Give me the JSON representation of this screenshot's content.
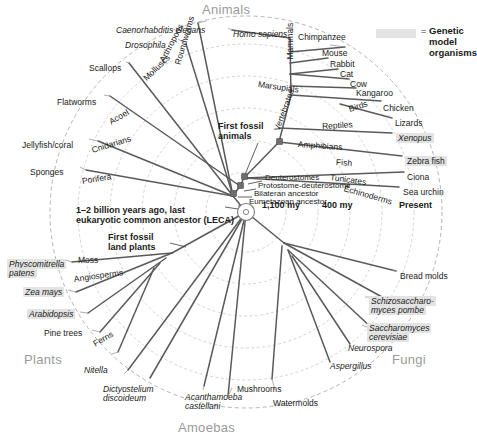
{
  "figure": {
    "type": "radial-phylogenetic-tree",
    "center": {
      "x": 246,
      "y": 212
    },
    "kingdoms": [
      {
        "name": "Animals",
        "x": 202,
        "y": 4,
        "align": "left"
      },
      {
        "name": "Fungi",
        "x": 392,
        "y": 355,
        "align": "left"
      },
      {
        "name": "Plants",
        "x": 24,
        "y": 356,
        "align": "left"
      },
      {
        "name": "Amoebas",
        "x": 178,
        "y": 424,
        "align": "left"
      }
    ],
    "time_axis": [
      {
        "label": "1,100 my",
        "x": 262,
        "y": 206
      },
      {
        "label": "400 my",
        "x": 322,
        "y": 206
      },
      {
        "label": "Present",
        "x": 399,
        "y": 206
      }
    ],
    "legend": {
      "swatch_color": "#e3e3e3",
      "equals": "=",
      "line1": "Genetic model",
      "line2": "organisms"
    },
    "node_labels": [
      {
        "text": "Deuterostomes",
        "x": 262,
        "y": 178
      },
      {
        "text": "Protostome-deuterostome",
        "x": 258,
        "y": 186
      },
      {
        "text": "Bilateran ancestor",
        "x": 254,
        "y": 194
      },
      {
        "text": "Eumetazoan ancestor",
        "x": 248,
        "y": 202
      }
    ],
    "annotations": [
      {
        "text": "First fossil",
        "line2": "animals",
        "x": 218,
        "y": 126,
        "bold": true
      },
      {
        "text": "First fossil",
        "line2": "land plants",
        "x": 108,
        "y": 237,
        "bold": true
      },
      {
        "text": "1–2 billion years ago, last",
        "line2": "eukaryotic common ancestor (LECA)",
        "x": 76,
        "y": 210,
        "bold": true
      }
    ],
    "branch_names": [
      {
        "text": "Roundworms",
        "x": 178,
        "y": 60,
        "rot": -74
      },
      {
        "text": "Arthropods",
        "x": 162,
        "y": 57,
        "rot": -62
      },
      {
        "text": "Molluscs",
        "x": 145,
        "y": 75,
        "rot": -44
      },
      {
        "text": "Acoel",
        "x": 110,
        "y": 118,
        "rot": -30
      },
      {
        "text": "Cnidarians",
        "x": 92,
        "y": 146,
        "rot": -17
      },
      {
        "text": "Porifera",
        "x": 82,
        "y": 177,
        "rot": -9
      },
      {
        "text": "Mammals",
        "x": 291,
        "y": 55,
        "rot": -90
      },
      {
        "text": "Vertebrates",
        "x": 277,
        "y": 126,
        "rot": -70
      },
      {
        "text": "Marsupials",
        "x": 258,
        "y": 80,
        "rot": 8
      },
      {
        "text": "Birds",
        "x": 349,
        "y": 105,
        "rot": -18
      },
      {
        "text": "Reptiles",
        "x": 322,
        "y": 122,
        "rot": -3
      },
      {
        "text": "Amphibians",
        "x": 298,
        "y": 140,
        "rot": 4
      },
      {
        "text": "Fish",
        "x": 336,
        "y": 158,
        "rot": 4
      },
      {
        "text": "Tunicates",
        "x": 330,
        "y": 173,
        "rot": 8
      },
      {
        "text": "Echinoderms",
        "x": 344,
        "y": 184,
        "rot": 16
      },
      {
        "text": "Moss",
        "x": 78,
        "y": 256,
        "rot": 0
      },
      {
        "text": "Angiosperms",
        "x": 74,
        "y": 275,
        "rot": -8
      },
      {
        "text": "Ferns",
        "x": 94,
        "y": 340,
        "rot": -30
      },
      {
        "text": "Mushrooms",
        "x": 237,
        "y": 385,
        "rot": 0
      },
      {
        "text": "Watermolds",
        "x": 273,
        "y": 399,
        "rot": 0
      },
      {
        "text": "Aspergillus",
        "x": 330,
        "y": 362,
        "rot": 0,
        "italic": true
      },
      {
        "text": "Neurospora",
        "x": 348,
        "y": 344,
        "rot": 0,
        "italic": true
      }
    ],
    "tips": [
      {
        "text": "Caenorhabditis elegans",
        "x": 116,
        "y": 26,
        "align": "left",
        "italic": true,
        "model": false
      },
      {
        "text": "Drosophila",
        "x": 125,
        "y": 41,
        "align": "left",
        "italic": true,
        "model": false
      },
      {
        "text": "Scallops",
        "x": 89,
        "y": 64,
        "align": "left",
        "italic": false,
        "model": false
      },
      {
        "text": "Flatworms",
        "x": 57,
        "y": 98,
        "align": "left",
        "italic": false,
        "model": false
      },
      {
        "text": "Jellyfish/coral",
        "x": 22,
        "y": 141,
        "align": "left",
        "italic": false,
        "model": false
      },
      {
        "text": "Sponges",
        "x": 30,
        "y": 168,
        "align": "left",
        "italic": false,
        "model": false
      },
      {
        "text": "Homo sapiens",
        "x": 233,
        "y": 30,
        "align": "left",
        "italic": true,
        "model": false
      },
      {
        "text": "Chimpanzee",
        "x": 298,
        "y": 33,
        "align": "left",
        "italic": false,
        "model": false
      },
      {
        "text": "Mouse",
        "x": 322,
        "y": 49,
        "align": "left",
        "italic": false,
        "model": false
      },
      {
        "text": "Rabbit",
        "x": 330,
        "y": 60,
        "align": "left",
        "italic": false,
        "model": false
      },
      {
        "text": "Cat",
        "x": 340,
        "y": 70,
        "align": "left",
        "italic": false,
        "model": false
      },
      {
        "text": "Cow",
        "x": 350,
        "y": 80,
        "align": "left",
        "italic": false,
        "model": false
      },
      {
        "text": "Kangaroo",
        "x": 356,
        "y": 89,
        "align": "left",
        "italic": false,
        "model": false
      },
      {
        "text": "Chicken",
        "x": 383,
        "y": 104,
        "align": "left",
        "italic": false,
        "model": false
      },
      {
        "text": "Lizards",
        "x": 395,
        "y": 119,
        "align": "left",
        "italic": false,
        "model": false
      },
      {
        "text": "Xenopus",
        "x": 396,
        "y": 134,
        "align": "left",
        "italic": true,
        "model": true
      },
      {
        "text": "Zebra fish",
        "x": 405,
        "y": 157,
        "align": "left",
        "italic": false,
        "model": true
      },
      {
        "text": "Ciona",
        "x": 407,
        "y": 173,
        "align": "left",
        "italic": false,
        "model": false
      },
      {
        "text": "Sea urchin",
        "x": 403,
        "y": 188,
        "align": "left",
        "italic": false,
        "model": false
      },
      {
        "text": "Bread molds",
        "x": 400,
        "y": 272,
        "align": "left",
        "italic": false,
        "model": false
      },
      {
        "text": "Schizosaccharo-",
        "line2": "myces pombe",
        "x": 369,
        "y": 297,
        "align": "left",
        "italic": true,
        "model": true
      },
      {
        "text": "Saccharomyces",
        "line2": "cerevisiae",
        "x": 367,
        "y": 324,
        "align": "left",
        "italic": true,
        "model": true
      },
      {
        "text": "Physcomitrella",
        "line2": "patens",
        "x": 7,
        "y": 260,
        "align": "left",
        "italic": true,
        "model": true
      },
      {
        "text": "Zea mays",
        "x": 23,
        "y": 288,
        "align": "left",
        "italic": true,
        "model": true
      },
      {
        "text": "Arabidopsis",
        "x": 27,
        "y": 310,
        "align": "left",
        "italic": true,
        "model": true
      },
      {
        "text": "Pine trees",
        "x": 44,
        "y": 329,
        "align": "left",
        "italic": false,
        "model": false
      },
      {
        "text": "Nitella",
        "x": 84,
        "y": 366,
        "align": "left",
        "italic": true,
        "model": false
      },
      {
        "text": "Dictyostelium",
        "line2": "discoideum",
        "x": 103,
        "y": 385,
        "align": "left",
        "italic": true,
        "model": false
      },
      {
        "text": "Acanthamoeba",
        "line2": "castellani",
        "x": 185,
        "y": 393,
        "align": "left",
        "italic": true,
        "model": false
      }
    ]
  },
  "chart_data": {
    "type": "diagram-radial-tree",
    "root": "1–2 billion years ago, last eukaryotic common ancestor (LECA)",
    "radial_axis": "time (my before present, increasing outward)",
    "rings": [
      "1,100 my",
      "400 my",
      "Present"
    ],
    "groups": [
      "Animals",
      "Fungi",
      "Plants",
      "Amoebas"
    ],
    "model_organisms": [
      "Xenopus",
      "Zebra fish",
      "Schizosaccharomyces pombe",
      "Saccharomyces cerevisiae",
      "Physcomitrella patens",
      "Zea mays",
      "Arabidopsis"
    ]
  }
}
